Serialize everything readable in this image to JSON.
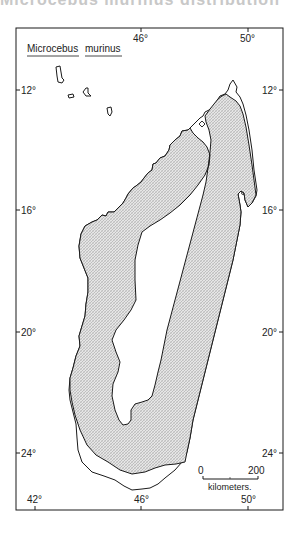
{
  "header_cutoff": "Microcebus murinus distribution",
  "map": {
    "title_genus": "Microcebus",
    "title_species": "murinus",
    "longitude_ticks_top": [
      {
        "label": "46°",
        "x": 141
      },
      {
        "label": "50°",
        "x": 248
      }
    ],
    "longitude_ticks_bottom": [
      {
        "label": "42°",
        "x": 35
      },
      {
        "label": "46°",
        "x": 141
      },
      {
        "label": "50°",
        "x": 248
      }
    ],
    "latitude_ticks_left": [
      {
        "label": "12°",
        "y": 90
      },
      {
        "label": "16°",
        "y": 210
      },
      {
        "label": "20°",
        "y": 332
      },
      {
        "label": "24°",
        "y": 453
      }
    ],
    "latitude_ticks_right": [
      {
        "label": "12°",
        "y": 90
      },
      {
        "label": "16°",
        "y": 210
      },
      {
        "label": "20°",
        "y": 332
      },
      {
        "label": "24°",
        "y": 453
      }
    ],
    "scale_bar": {
      "start_label": "0",
      "end_label": "200",
      "unit_label": "kilometers."
    },
    "colors": {
      "outline": "#1a1a1a",
      "range_fill": "#d9d9d9",
      "background": "#ffffff"
    },
    "legend_region": "Stippled area: range of Microcebus murinus"
  }
}
